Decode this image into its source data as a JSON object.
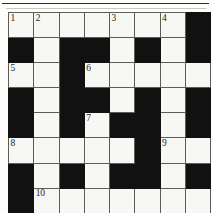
{
  "puzzle": {
    "kind": "crossword-grid",
    "rows": 8,
    "columns": 8,
    "colors": {
      "block": "#111111",
      "cell": "#f7f7f3",
      "gridline": "#5c5c58",
      "border": "#3a3a38",
      "number_text": "#1d1d1d",
      "page_background": "#fdfdfb",
      "top_rule": "#2b2b2b"
    },
    "numbers_present": [
      "1",
      "2",
      "3",
      "4",
      "5",
      "6",
      "7",
      "8",
      "9",
      "10"
    ],
    "grid": [
      [
        {
          "block": false,
          "number": "1"
        },
        {
          "block": false,
          "number": "2"
        },
        {
          "block": false,
          "number": ""
        },
        {
          "block": false,
          "number": ""
        },
        {
          "block": false,
          "number": "3"
        },
        {
          "block": false,
          "number": ""
        },
        {
          "block": false,
          "number": "4"
        },
        {
          "block": true,
          "number": ""
        }
      ],
      [
        {
          "block": true,
          "number": ""
        },
        {
          "block": false,
          "number": ""
        },
        {
          "block": true,
          "number": ""
        },
        {
          "block": true,
          "number": ""
        },
        {
          "block": false,
          "number": ""
        },
        {
          "block": true,
          "number": ""
        },
        {
          "block": false,
          "number": ""
        },
        {
          "block": true,
          "number": ""
        }
      ],
      [
        {
          "block": false,
          "number": "5"
        },
        {
          "block": false,
          "number": ""
        },
        {
          "block": true,
          "number": ""
        },
        {
          "block": false,
          "number": "6"
        },
        {
          "block": false,
          "number": ""
        },
        {
          "block": false,
          "number": ""
        },
        {
          "block": false,
          "number": ""
        },
        {
          "block": false,
          "number": ""
        }
      ],
      [
        {
          "block": true,
          "number": ""
        },
        {
          "block": false,
          "number": ""
        },
        {
          "block": true,
          "number": ""
        },
        {
          "block": true,
          "number": ""
        },
        {
          "block": false,
          "number": ""
        },
        {
          "block": true,
          "number": ""
        },
        {
          "block": false,
          "number": ""
        },
        {
          "block": true,
          "number": ""
        }
      ],
      [
        {
          "block": true,
          "number": ""
        },
        {
          "block": false,
          "number": ""
        },
        {
          "block": true,
          "number": ""
        },
        {
          "block": false,
          "number": "7"
        },
        {
          "block": true,
          "number": ""
        },
        {
          "block": true,
          "number": ""
        },
        {
          "block": false,
          "number": ""
        },
        {
          "block": true,
          "number": ""
        }
      ],
      [
        {
          "block": false,
          "number": "8"
        },
        {
          "block": false,
          "number": ""
        },
        {
          "block": false,
          "number": ""
        },
        {
          "block": false,
          "number": ""
        },
        {
          "block": false,
          "number": ""
        },
        {
          "block": true,
          "number": ""
        },
        {
          "block": false,
          "number": "9"
        },
        {
          "block": false,
          "number": ""
        }
      ],
      [
        {
          "block": true,
          "number": ""
        },
        {
          "block": false,
          "number": ""
        },
        {
          "block": true,
          "number": ""
        },
        {
          "block": false,
          "number": ""
        },
        {
          "block": true,
          "number": ""
        },
        {
          "block": true,
          "number": ""
        },
        {
          "block": false,
          "number": ""
        },
        {
          "block": true,
          "number": ""
        }
      ],
      [
        {
          "block": true,
          "number": ""
        },
        {
          "block": false,
          "number": "10"
        },
        {
          "block": false,
          "number": ""
        },
        {
          "block": false,
          "number": ""
        },
        {
          "block": false,
          "number": ""
        },
        {
          "block": false,
          "number": ""
        },
        {
          "block": false,
          "number": ""
        },
        {
          "block": false,
          "number": ""
        }
      ]
    ]
  }
}
